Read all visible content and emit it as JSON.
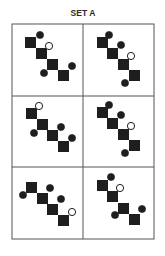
{
  "title": "SET A",
  "colors": {
    "ink": "#1e1e1e",
    "grid": "#555555",
    "background": "#ffffff"
  },
  "grid": {
    "rows": 3,
    "cols": 2,
    "left": 12,
    "top": 24,
    "right": 154,
    "bottom": 239,
    "col_split": 83,
    "row_splits": [
      96,
      167
    ]
  },
  "panels": [
    {
      "id": "panel-1",
      "squares": [
        [
          25,
          37,
          11
        ],
        [
          36,
          48,
          11
        ],
        [
          47,
          59,
          11
        ],
        [
          58,
          70,
          11
        ]
      ],
      "circles": [
        {
          "cx": 40,
          "cy": 35,
          "filled": true
        },
        {
          "cx": 49,
          "cy": 46,
          "filled": false
        },
        {
          "cx": 44,
          "cy": 73,
          "filled": true
        },
        {
          "cx": 72,
          "cy": 66,
          "filled": true
        }
      ]
    },
    {
      "id": "panel-2",
      "squares": [
        [
          97,
          37,
          11
        ],
        [
          107,
          48,
          11
        ],
        [
          118,
          59,
          11
        ],
        [
          129,
          70,
          11
        ]
      ],
      "circles": [
        {
          "cx": 109,
          "cy": 35,
          "filled": true
        },
        {
          "cx": 121,
          "cy": 45,
          "filled": true
        },
        {
          "cx": 131,
          "cy": 56,
          "filled": false
        },
        {
          "cx": 125,
          "cy": 83,
          "filled": true
        }
      ]
    },
    {
      "id": "panel-3",
      "squares": [
        [
          26,
          108,
          11
        ],
        [
          37,
          119,
          11
        ],
        [
          47,
          130,
          11
        ],
        [
          58,
          141,
          11
        ]
      ],
      "circles": [
        {
          "cx": 39,
          "cy": 106,
          "filled": false
        },
        {
          "cx": 34,
          "cy": 133,
          "filled": true
        },
        {
          "cx": 61,
          "cy": 127,
          "filled": true
        },
        {
          "cx": 72,
          "cy": 138,
          "filled": true
        }
      ]
    },
    {
      "id": "panel-4",
      "squares": [
        [
          97,
          107,
          11
        ],
        [
          107,
          118,
          11
        ],
        [
          118,
          129,
          11
        ],
        [
          129,
          140,
          11
        ]
      ],
      "circles": [
        {
          "cx": 109,
          "cy": 105,
          "filled": true
        },
        {
          "cx": 121,
          "cy": 115,
          "filled": true
        },
        {
          "cx": 131,
          "cy": 126,
          "filled": false
        },
        {
          "cx": 125,
          "cy": 153,
          "filled": true
        }
      ]
    },
    {
      "id": "panel-5",
      "squares": [
        [
          26,
          182,
          11
        ],
        [
          37,
          193,
          11
        ],
        [
          47,
          204,
          11
        ],
        [
          58,
          215,
          11
        ]
      ],
      "circles": [
        {
          "cx": 23,
          "cy": 195,
          "filled": true
        },
        {
          "cx": 50,
          "cy": 188,
          "filled": true
        },
        {
          "cx": 61,
          "cy": 199,
          "filled": true
        },
        {
          "cx": 72,
          "cy": 212,
          "filled": false
        }
      ]
    },
    {
      "id": "panel-6",
      "squares": [
        [
          97,
          180,
          11
        ],
        [
          107,
          191,
          11
        ],
        [
          118,
          203,
          11
        ],
        [
          129,
          214,
          11
        ]
      ],
      "circles": [
        {
          "cx": 111,
          "cy": 177,
          "filled": true
        },
        {
          "cx": 120,
          "cy": 188,
          "filled": false
        },
        {
          "cx": 115,
          "cy": 215,
          "filled": true
        },
        {
          "cx": 142,
          "cy": 209,
          "filled": true
        }
      ]
    }
  ]
}
